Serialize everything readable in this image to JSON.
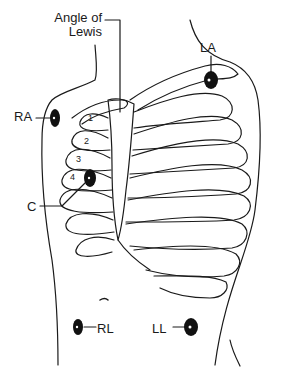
{
  "diagram": {
    "type": "anatomical-illustration",
    "labels": {
      "angle_of_lewis": "Angle of\nLewis",
      "angle_line1": "Angle of",
      "angle_line2": "Lewis",
      "la": "LA",
      "ra": "RA",
      "c": "C",
      "rl": "RL",
      "ll": "LL"
    },
    "rib_numbers": [
      "1",
      "2",
      "3",
      "4"
    ],
    "electrodes": [
      {
        "id": "LA",
        "name": "Left arm",
        "x": 211,
        "y": 80
      },
      {
        "id": "RA",
        "name": "Right arm",
        "x": 55,
        "y": 118
      },
      {
        "id": "C",
        "name": "Chest",
        "x": 90,
        "y": 178
      },
      {
        "id": "RL",
        "name": "Right leg",
        "x": 78,
        "y": 327
      },
      {
        "id": "LL",
        "name": "Left leg",
        "x": 191,
        "y": 327
      }
    ],
    "colors": {
      "line": "#1a1a1a",
      "electrode": "#111111",
      "background": "#ffffff"
    }
  }
}
